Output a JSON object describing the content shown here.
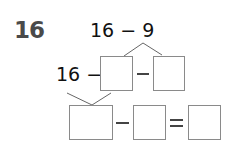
{
  "problem": {
    "number": "16",
    "expression": "16 − 9",
    "row2_prefix": "16 −",
    "row2_minus": "−",
    "row3_minus": "−",
    "row3_equals": "="
  },
  "boxes": [
    "",
    "",
    "",
    "",
    ""
  ]
}
